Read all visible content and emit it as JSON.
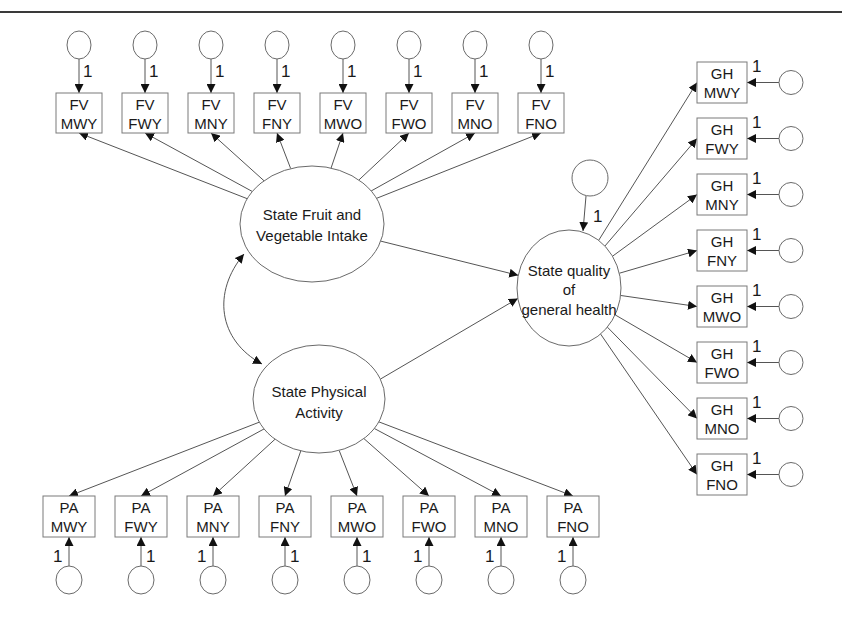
{
  "diagram": {
    "type": "structural-equation-model",
    "latents": {
      "fv": {
        "label_line1": "State Fruit and",
        "label_line2": "Vegetable Intake",
        "cx": 312,
        "cy": 224,
        "rx": 72,
        "ry": 58
      },
      "pa": {
        "label_line1": "State Physical",
        "label_line2": "Activity",
        "cx": 319,
        "cy": 399,
        "rx": 66,
        "ry": 54
      },
      "gh": {
        "label_line1": "State quality",
        "label_line2": "of",
        "label_line3": "general health",
        "cx": 569,
        "cy": 288,
        "rx": 52,
        "ry": 58
      }
    },
    "gh_disturbance": {
      "cx": 590,
      "cy": 178,
      "r": 18,
      "weight": "1"
    },
    "covariance": {
      "from": "fv",
      "to": "pa"
    },
    "regressions": [
      {
        "from": "fv",
        "to": "gh"
      },
      {
        "from": "pa",
        "to": "gh"
      }
    ],
    "fv_indicators": [
      {
        "line1": "FV",
        "line2": "MWY",
        "weight": "1"
      },
      {
        "line1": "FV",
        "line2": "FWY",
        "weight": "1"
      },
      {
        "line1": "FV",
        "line2": "MNY",
        "weight": "1"
      },
      {
        "line1": "FV",
        "line2": "FNY",
        "weight": "1"
      },
      {
        "line1": "FV",
        "line2": "MWO",
        "weight": "1"
      },
      {
        "line1": "FV",
        "line2": "FWO",
        "weight": "1"
      },
      {
        "line1": "FV",
        "line2": "MNO",
        "weight": "1"
      },
      {
        "line1": "FV",
        "line2": "FNO",
        "weight": "1"
      }
    ],
    "pa_indicators": [
      {
        "line1": "PA",
        "line2": "MWY",
        "weight": "1"
      },
      {
        "line1": "PA",
        "line2": "FWY",
        "weight": "1"
      },
      {
        "line1": "PA",
        "line2": "MNY",
        "weight": "1"
      },
      {
        "line1": "PA",
        "line2": "FNY",
        "weight": "1"
      },
      {
        "line1": "PA",
        "line2": "MWO",
        "weight": "1"
      },
      {
        "line1": "PA",
        "line2": "FWO",
        "weight": "1"
      },
      {
        "line1": "PA",
        "line2": "MNO",
        "weight": "1"
      },
      {
        "line1": "PA",
        "line2": "FNO",
        "weight": "1"
      }
    ],
    "gh_indicators": [
      {
        "line1": "GH",
        "line2": "MWY",
        "weight": "1"
      },
      {
        "line1": "GH",
        "line2": "FWY",
        "weight": "1"
      },
      {
        "line1": "GH",
        "line2": "MNY",
        "weight": "1"
      },
      {
        "line1": "GH",
        "line2": "FNY",
        "weight": "1"
      },
      {
        "line1": "GH",
        "line2": "MWO",
        "weight": "1"
      },
      {
        "line1": "GH",
        "line2": "FWO",
        "weight": "1"
      },
      {
        "line1": "GH",
        "line2": "MNO",
        "weight": "1"
      },
      {
        "line1": "GH",
        "line2": "FNO",
        "weight": "1"
      }
    ]
  }
}
